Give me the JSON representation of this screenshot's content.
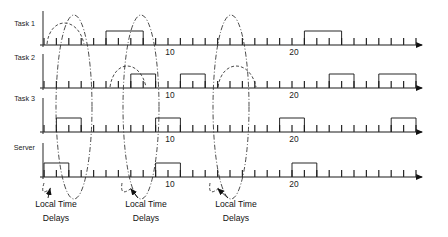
{
  "figure": {
    "title": "",
    "type": "timing-diagram",
    "width": 448,
    "height": 237,
    "background": "#ffffff",
    "line_color": "#1b1b1b"
  },
  "rows": [
    {
      "id": "task1",
      "label": "Task 1",
      "axis_y": 45,
      "label_y": 26,
      "tick_label": "10",
      "tick_label2": "20"
    },
    {
      "id": "task2",
      "label": "Task 2",
      "axis_y": 88,
      "label_y": 60,
      "tick_label": "10",
      "tick_label2": "20"
    },
    {
      "id": "task3",
      "label": "Task 3",
      "axis_y": 132,
      "label_y": 101,
      "tick_label": "10",
      "tick_label2": "20"
    },
    {
      "id": "server",
      "label": "Server",
      "axis_y": 177,
      "label_y": 150,
      "tick_label": "10",
      "tick_label2": "20"
    }
  ],
  "axis": {
    "x_start": 44,
    "x_end": 424,
    "tick_spacing": 12.4,
    "tick_count": 30,
    "tick_height": 7,
    "arrow_label": "time-arrow"
  },
  "tick_labels": [
    {
      "text": "10",
      "x": 170
    },
    {
      "text": "20",
      "x": 294
    }
  ],
  "pulses": {
    "task1": [
      {
        "start": 5,
        "end": 8
      },
      {
        "start": 21,
        "end": 24
      }
    ],
    "task2": [
      {
        "start": 7,
        "end": 9
      },
      {
        "start": 11,
        "end": 13
      },
      {
        "start": 23,
        "end": 25
      },
      {
        "start": 27,
        "end": 30
      }
    ],
    "task3": [
      {
        "start": 1,
        "end": 3
      },
      {
        "start": 9,
        "end": 11
      },
      {
        "start": 19,
        "end": 21
      },
      {
        "start": 28,
        "end": 30
      }
    ],
    "server": [
      {
        "start": 0,
        "end": 2
      },
      {
        "start": 9,
        "end": 11
      },
      {
        "start": 20,
        "end": 22
      }
    ]
  },
  "annotations": [
    {
      "id": "ltd-1",
      "line1": "Local Time",
      "line2": "Delays",
      "x": 56,
      "y1": 207,
      "y2": 221,
      "arrow_tip_x": 50,
      "arrow_tip_y": 189
    },
    {
      "id": "ltd-2",
      "line1": "Local Time",
      "line2": "Delays",
      "x": 146,
      "y1": 207,
      "y2": 221,
      "arrow_tip_x": 131,
      "arrow_tip_y": 189
    },
    {
      "id": "ltd-3",
      "line1": "Local Time",
      "line2": "Delays",
      "x": 236,
      "y1": 207,
      "y2": 221,
      "arrow_tip_x": 218,
      "arrow_tip_y": 189
    }
  ],
  "ellipses": [
    {
      "id": "delay-ellipse-1",
      "cx": 74,
      "cy": 107,
      "rx": 18,
      "ry": 92
    },
    {
      "id": "delay-ellipse-2",
      "cx": 141,
      "cy": 107,
      "rx": 18,
      "ry": 92
    },
    {
      "id": "delay-ellipse-3",
      "cx": 231,
      "cy": 107,
      "rx": 18,
      "ry": 92
    }
  ],
  "dashed_arcs": [
    {
      "id": "arc-t1-a",
      "d": "M 47 44 C 50 16, 78 16, 84 44"
    },
    {
      "id": "arc-t2-a",
      "d": "M 110 87 C 114 59, 140 59, 146 87"
    },
    {
      "id": "arc-t2-b",
      "d": "M 218 87 C 222 59, 250 59, 256 87"
    },
    {
      "id": "arc-a1",
      "d": "M 44 183 C 40 196, 46 192, 51 188"
    },
    {
      "id": "arc-a2",
      "d": "M 122 183 C 120 196, 126 192, 132 188"
    },
    {
      "id": "arc-a3",
      "d": "M 210 183 C 208 196, 214 192, 219 188"
    }
  ]
}
